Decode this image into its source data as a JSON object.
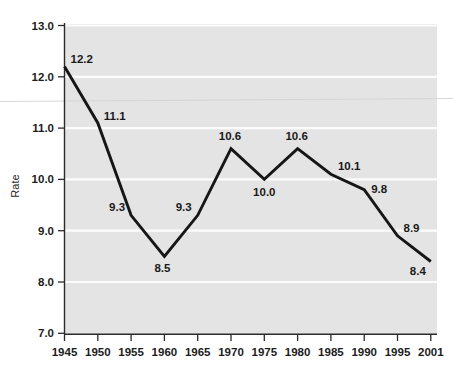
{
  "chart_data": {
    "type": "line",
    "title": "",
    "subtitle": "",
    "xlabel": "",
    "ylabel": "Rate",
    "categories": [
      "1945",
      "1950",
      "1955",
      "1960",
      "1965",
      "1970",
      "1975",
      "1980",
      "1985",
      "1990",
      "1995",
      "2001"
    ],
    "values": [
      12.2,
      11.1,
      9.3,
      8.5,
      9.3,
      10.6,
      10.0,
      10.6,
      10.1,
      9.8,
      8.9,
      8.4
    ],
    "data_labels": [
      "12.2",
      "11.1",
      "9.3",
      "8.5",
      "9.3",
      "10.6",
      "10.0",
      "10.6",
      "10.1",
      "9.8",
      "8.9",
      "8.4"
    ],
    "xlim": [
      1945,
      2001
    ],
    "ylim": [
      7.0,
      13.0
    ],
    "yticks": [
      13.0,
      12.0,
      11.0,
      10.0,
      9.0,
      8.0,
      7.0
    ],
    "ytick_labels": [
      "13.0",
      "12.0",
      "11.0",
      "10.0",
      "9.0",
      "8.0",
      "7.0"
    ],
    "xtick_labels": [
      "1945",
      "1950",
      "1955",
      "1960",
      "1965",
      "1970",
      "1975",
      "1980",
      "1985",
      "1990",
      "1995",
      "2001"
    ],
    "grid": true,
    "legend": false,
    "legend_position": "none",
    "series": [
      {
        "name": "Rate",
        "values": [
          12.2,
          11.1,
          9.3,
          8.5,
          9.3,
          10.6,
          10.0,
          10.6,
          10.1,
          9.8,
          8.9,
          8.4
        ]
      }
    ],
    "colors": {
      "line": "#161616",
      "plot_background": "#e4e4e4",
      "gridline": "#fcfcfc",
      "axis": "#2b2b2b",
      "page_background": "#ffffff",
      "label_text": "#1a1a1a"
    },
    "label_offsets": [
      {
        "label": "12.2",
        "dx": 6,
        "dy": -4,
        "anchor": "start"
      },
      {
        "label": "11.1",
        "dx": 6,
        "dy": -3,
        "anchor": "start"
      },
      {
        "label": "9.3",
        "dx": -6,
        "dy": -4,
        "anchor": "end"
      },
      {
        "label": "8.5",
        "dx": -2,
        "dy": 16,
        "anchor": "middle"
      },
      {
        "label": "9.3",
        "dx": -6,
        "dy": -4,
        "anchor": "end"
      },
      {
        "label": "10.6",
        "dx": -1,
        "dy": -9,
        "anchor": "middle"
      },
      {
        "label": "10.0",
        "dx": 0,
        "dy": 17,
        "anchor": "middle"
      },
      {
        "label": "10.6",
        "dx": -1,
        "dy": -9,
        "anchor": "middle"
      },
      {
        "label": "10.1",
        "dx": 7,
        "dy": -4,
        "anchor": "start"
      },
      {
        "label": "9.8",
        "dx": 7,
        "dy": 3,
        "anchor": "start"
      },
      {
        "label": "8.9",
        "dx": 6,
        "dy": -4,
        "anchor": "start"
      },
      {
        "label": "8.4",
        "dx": -5,
        "dy": 14,
        "anchor": "end"
      }
    ]
  }
}
